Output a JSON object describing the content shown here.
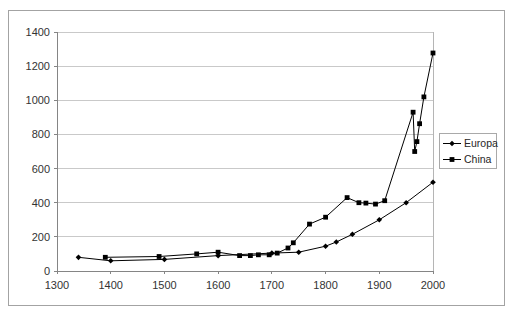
{
  "window": {
    "background_color": "#ffffff",
    "frame_border_color": "#a3a3a3"
  },
  "chart_data": {
    "type": "line",
    "title": "",
    "xlabel": "",
    "ylabel": "",
    "xlim": [
      1300,
      2000
    ],
    "ylim": [
      0,
      1400
    ],
    "x_ticks": [
      1300,
      1400,
      1500,
      1600,
      1700,
      1800,
      1900,
      2000
    ],
    "y_ticks": [
      0,
      200,
      400,
      600,
      800,
      1000,
      1200,
      1400
    ],
    "grid": "horizontal-only",
    "gridline_color": "#c9c9c9",
    "axis_color": "#858585",
    "plot_border_color": "#b5b5b5",
    "text_color": "#333333",
    "series_color": "#000000",
    "legend_position": "right-outside",
    "series": [
      {
        "name": "Europa",
        "marker": "diamond",
        "color": "#000000",
        "points": [
          [
            1340,
            80
          ],
          [
            1400,
            60
          ],
          [
            1500,
            68
          ],
          [
            1600,
            90
          ],
          [
            1700,
            105
          ],
          [
            1750,
            110
          ],
          [
            1800,
            145
          ],
          [
            1820,
            170
          ],
          [
            1850,
            215
          ],
          [
            1900,
            300
          ],
          [
            1950,
            400
          ],
          [
            2000,
            520
          ]
        ]
      },
      {
        "name": "China",
        "marker": "square",
        "color": "#000000",
        "points": [
          [
            1390,
            80
          ],
          [
            1490,
            85
          ],
          [
            1560,
            100
          ],
          [
            1600,
            110
          ],
          [
            1640,
            90
          ],
          [
            1660,
            90
          ],
          [
            1675,
            95
          ],
          [
            1695,
            95
          ],
          [
            1710,
            105
          ],
          [
            1730,
            135
          ],
          [
            1740,
            165
          ],
          [
            1770,
            275
          ],
          [
            1800,
            315
          ],
          [
            1840,
            430
          ],
          [
            1862,
            400
          ],
          [
            1875,
            398
          ],
          [
            1893,
            392
          ],
          [
            1910,
            412
          ],
          [
            1963,
            930
          ],
          [
            1966,
            700
          ],
          [
            1970,
            758
          ],
          [
            1975,
            863
          ],
          [
            1983,
            1020
          ],
          [
            2000,
            1277
          ]
        ]
      }
    ]
  }
}
